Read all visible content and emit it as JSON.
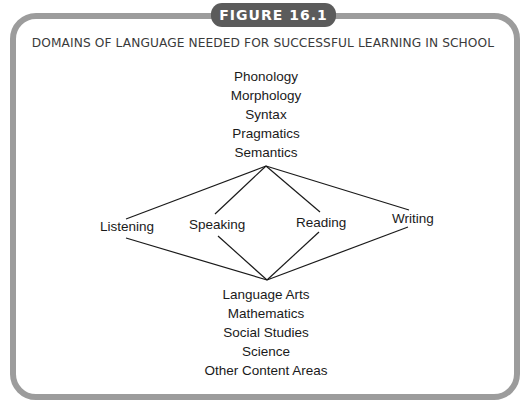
{
  "figure": {
    "badge": "FIGURE 16.1",
    "title": "DOMAINS OF LANGUAGE NEEDED FOR SUCCESSFUL LEARNING IN SCHOOL",
    "frame_color": "#9c9c9c",
    "badge_color": "#5b5b5b"
  },
  "diagram": {
    "top_items": [
      "Phonology",
      "Morphology",
      "Syntax",
      "Pragmatics",
      "Semantics"
    ],
    "middle_items": [
      "Listening",
      "Speaking",
      "Reading",
      "Writing"
    ],
    "bottom_items": [
      "Language Arts",
      "Mathematics",
      "Social Studies",
      "Science",
      "Other Content Areas"
    ],
    "edges": [
      {
        "from": "Language components",
        "to": "Listening"
      },
      {
        "from": "Language components",
        "to": "Speaking"
      },
      {
        "from": "Language components",
        "to": "Reading"
      },
      {
        "from": "Language components",
        "to": "Writing"
      },
      {
        "from": "Listening",
        "to": "Content areas"
      },
      {
        "from": "Speaking",
        "to": "Content areas"
      },
      {
        "from": "Reading",
        "to": "Content areas"
      },
      {
        "from": "Writing",
        "to": "Content areas"
      }
    ]
  }
}
